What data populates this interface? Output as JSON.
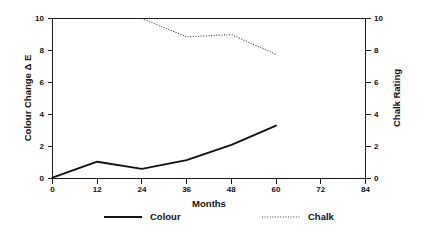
{
  "chart_data": {
    "type": "line",
    "title": "",
    "subtitle": "",
    "xlabel": "Months",
    "ylabel": "Colour Change Δ E",
    "y2label": "Chalk Rating",
    "xlim": [
      0,
      84
    ],
    "ylim": [
      0,
      10
    ],
    "y2lim": [
      0,
      10
    ],
    "grid": false,
    "legend_position": "bottom",
    "x_ticks": [
      0,
      12,
      24,
      36,
      48,
      60,
      72,
      84
    ],
    "x_tick_labels": [
      "0",
      "12",
      "24",
      "36",
      "48",
      "60",
      "72",
      "84"
    ],
    "y_ticks": [
      0,
      2,
      4,
      6,
      8,
      10
    ],
    "y_tick_labels": [
      "0",
      "2",
      "4",
      "6",
      "8",
      "10"
    ],
    "y2_ticks": [
      0,
      2,
      4,
      6,
      8,
      10
    ],
    "y2_tick_labels": [
      "0",
      "2",
      "4",
      "6",
      "8",
      "10"
    ],
    "series": [
      {
        "name": "Colour",
        "axis": "left",
        "style": "solid",
        "color": "#111111",
        "x": [
          0,
          12,
          24,
          36,
          48,
          60
        ],
        "values": [
          0.05,
          1.05,
          0.6,
          1.15,
          2.1,
          3.3
        ]
      },
      {
        "name": "Chalk",
        "axis": "right",
        "style": "dotted",
        "color": "#3a3a3a",
        "x": [
          24,
          36,
          48,
          60
        ],
        "values": [
          10.0,
          8.85,
          9.0,
          7.75
        ]
      }
    ]
  },
  "legend": {
    "items": [
      {
        "label": "Colour",
        "style": "solid"
      },
      {
        "label": "Chalk",
        "style": "dotted"
      }
    ]
  }
}
